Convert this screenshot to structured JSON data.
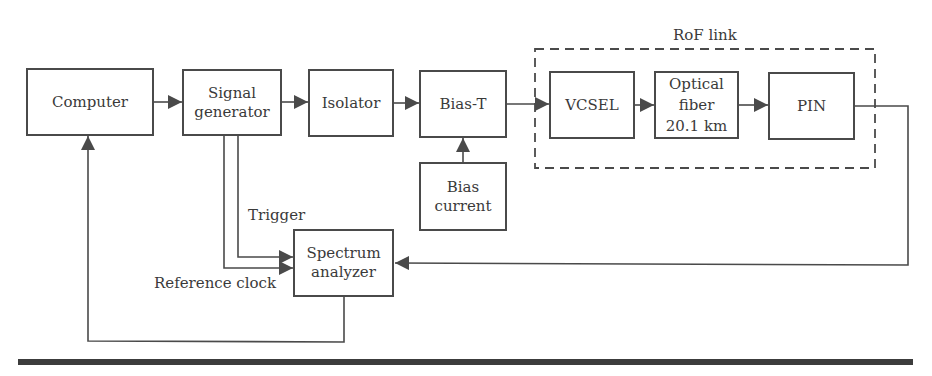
{
  "diagram": {
    "group": {
      "label": "RoF link"
    },
    "blocks": [
      {
        "id": "computer",
        "label": "Computer"
      },
      {
        "id": "signal_generator",
        "label": "Signal\ngenerator"
      },
      {
        "id": "isolator",
        "label": "Isolator"
      },
      {
        "id": "bias_t",
        "label": "Bias-T"
      },
      {
        "id": "bias_current",
        "label": "Bias\ncurrent"
      },
      {
        "id": "vcsel",
        "label": "VCSEL"
      },
      {
        "id": "optical_fiber",
        "label": "Optical\nfiber\n20.1 km"
      },
      {
        "id": "pin",
        "label": "PIN"
      },
      {
        "id": "spectrum_analyzer",
        "label": "Spectrum\nanalyzer"
      }
    ],
    "edge_labels": {
      "trigger": "Trigger",
      "reference_clock": "Reference clock"
    },
    "edges": [
      {
        "from": "computer",
        "to": "signal_generator"
      },
      {
        "from": "signal_generator",
        "to": "isolator"
      },
      {
        "from": "isolator",
        "to": "bias_t"
      },
      {
        "from": "bias_current",
        "to": "bias_t"
      },
      {
        "from": "bias_t",
        "to": "vcsel"
      },
      {
        "from": "vcsel",
        "to": "optical_fiber"
      },
      {
        "from": "optical_fiber",
        "to": "pin"
      },
      {
        "from": "pin",
        "to": "spectrum_analyzer"
      },
      {
        "from": "signal_generator",
        "to": "spectrum_analyzer",
        "label": "Trigger"
      },
      {
        "from": "signal_generator",
        "to": "spectrum_analyzer",
        "label": "Reference clock"
      },
      {
        "from": "spectrum_analyzer",
        "to": "computer"
      }
    ]
  },
  "colors": {
    "line": "#4a4a4a",
    "text": "#3a3a3a",
    "rule": "#3c3c3c"
  }
}
